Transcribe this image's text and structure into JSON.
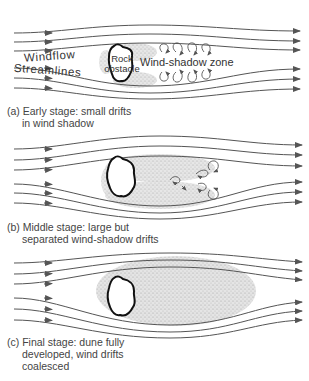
{
  "figure": {
    "panels": [
      {
        "id": "a",
        "caption_line1": "(a)  Early stage: small drifts",
        "caption_line2": "in wind shadow"
      },
      {
        "id": "b",
        "caption_line1": "(b)  Middle stage: large but",
        "caption_line2": "separated wind-shadow drifts"
      },
      {
        "id": "c",
        "caption_line1": "(c)  Final stage: dune fully",
        "caption_line2": "developed, wind drifts",
        "caption_line3": "coalesced"
      }
    ],
    "labels": {
      "windflow": "Windflow",
      "streamlines": "Streamlines",
      "rock_line1": "Rock",
      "rock_line2": "obstacle",
      "wind_shadow_zone": "Wind-shadow zone"
    },
    "colors": {
      "line": "#555555",
      "rock_outline": "#111111",
      "sand": "#c8c8c8"
    }
  }
}
